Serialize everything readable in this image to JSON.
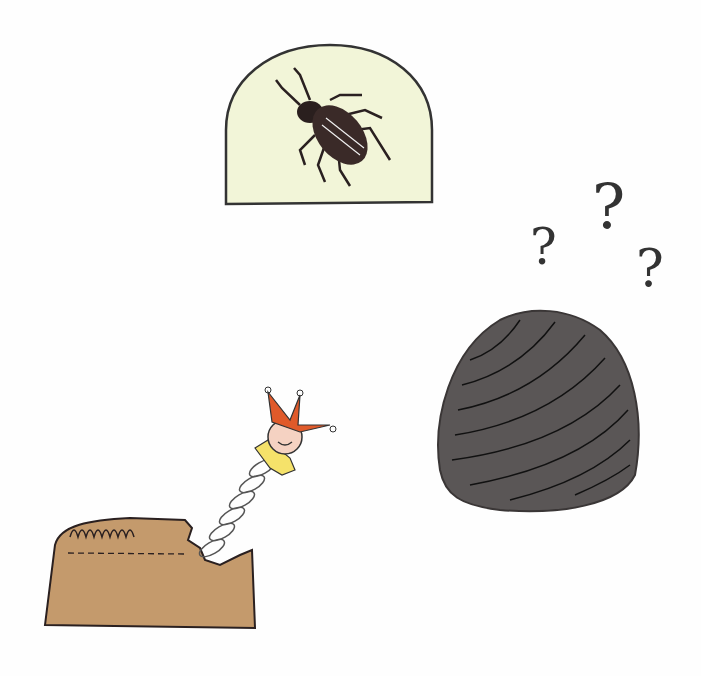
{
  "scene": {
    "description": "Hand-drawn illustration: beetle under a dome, jack-in-the-box bursting from a cork box, dark striped mound with question marks",
    "colors": {
      "dome_fill": "#f2f5d8",
      "beetle": "#3a2a28",
      "box": "#c49a6c",
      "mound": "#5a5656",
      "hat": "#e05a2a",
      "collar": "#f5e26a",
      "face": "#f5d2c2"
    },
    "question_marks": [
      "?",
      "?",
      "?"
    ]
  }
}
